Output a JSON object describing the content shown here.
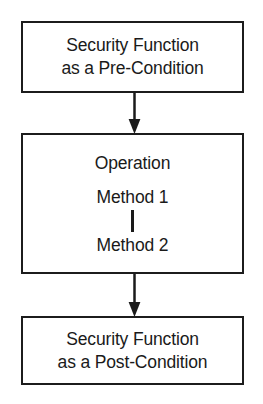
{
  "diagram": {
    "type": "flowchart",
    "orientation": "vertical-top-to-bottom",
    "stroke_color": "#1c1c1c",
    "background_color": "#ffffff",
    "nodes": [
      {
        "id": "pre-condition",
        "shape": "rectangle",
        "lines": [
          "Security Function",
          "as a Pre-Condition"
        ]
      },
      {
        "id": "operation",
        "shape": "rectangle",
        "lines": [
          "Operation",
          "Method 1",
          "Method 2"
        ],
        "inner_connector": "vertical-line"
      },
      {
        "id": "post-condition",
        "shape": "rectangle",
        "lines": [
          "Security Function",
          "as a Post-Condition"
        ]
      }
    ],
    "edges": [
      {
        "id": "pre-to-operation",
        "from": "pre-condition",
        "to": "operation",
        "style": "solid-arrow-down"
      },
      {
        "id": "operation-to-post",
        "from": "operation",
        "to": "post-condition",
        "style": "solid-arrow-down"
      }
    ]
  }
}
